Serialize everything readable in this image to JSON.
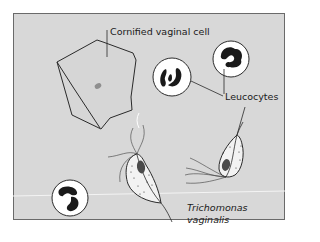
{
  "diagram": {
    "labels": {
      "cornified_cell": "Cornified vaginal cell",
      "leucocytes": "Leucocytes",
      "trichomonas_line1": "Trichomonas",
      "trichomonas_line2": "vaginalis"
    },
    "colors": {
      "panel_background": "#d8d8d8",
      "panel_border": "#6a6a6a",
      "cell_fill": "#dadada",
      "leucocyte_fill": "#ffffff",
      "nucleus_fill": "#1a1a1a",
      "trichomonas_fill": "#f2f2f2",
      "trichomonas_nucleus": "#4a4a4a",
      "outline": "#2a2a2a"
    },
    "elements": [
      {
        "type": "cornified-vaginal-cell",
        "count": 1
      },
      {
        "type": "leucocyte",
        "count": 3
      },
      {
        "type": "trichomonas-vaginalis",
        "count": 2
      }
    ]
  }
}
